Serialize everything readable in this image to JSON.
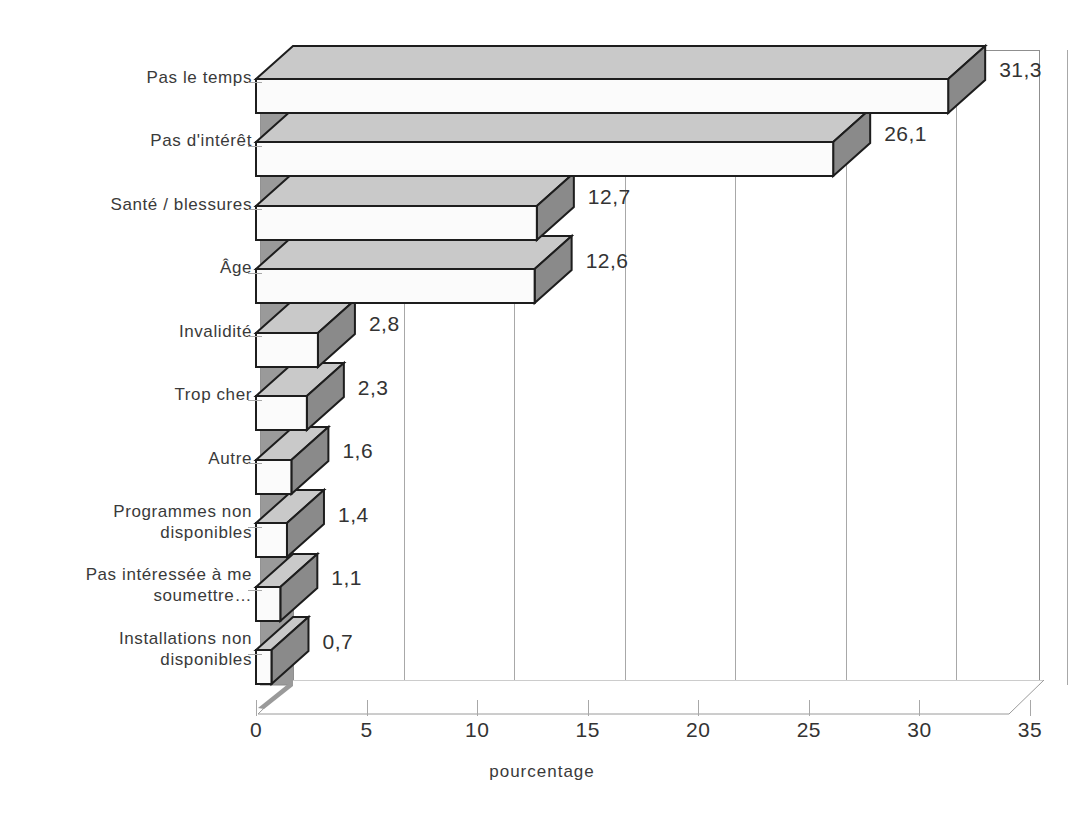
{
  "chart_data": {
    "type": "bar",
    "orientation": "horizontal",
    "title": "",
    "xlabel": "pourcentage",
    "ylabel": "",
    "xlim": [
      0,
      35
    ],
    "xticks": [
      "0",
      "5",
      "10",
      "15",
      "20",
      "25",
      "30",
      "35"
    ],
    "grid": "vertical",
    "legend": "none",
    "style": "3d-bar",
    "decimal_separator": ",",
    "categories": [
      "Installations non\ndisponibles",
      "Pas intéressée à me\nsoumettre…",
      "Programmes non\ndisponibles",
      "Autre",
      "Trop cher",
      "Invalidité",
      "Âge",
      "Santé / blessures",
      "Pas d'intérêt",
      "Pas le temps"
    ],
    "values": [
      0.7,
      1.1,
      1.4,
      1.6,
      2.3,
      2.8,
      12.6,
      12.7,
      26.1,
      31.3
    ],
    "value_labels": [
      "0,7",
      "1,1",
      "1,4",
      "1,6",
      "2,3",
      "2,8",
      "12,6",
      "12,7",
      "26,1",
      "31,3"
    ]
  },
  "colors": {
    "bar_front": "#fbfbfb",
    "bar_top": "#c9c9c9",
    "bar_side": "#8a8a8a",
    "bar_outline": "#1d1d1d",
    "wall": "#9a9a9a",
    "floor": "#d8d8d8",
    "gridline": "#a8a8a8",
    "text": "#333333",
    "background": "#ffffff"
  }
}
